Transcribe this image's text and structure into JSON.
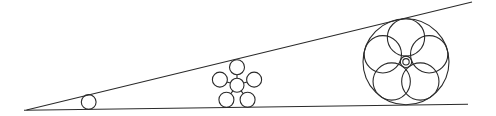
{
  "canvas": {
    "width": 496,
    "height": 116,
    "background": "#ffffff",
    "stroke_color": "#2a2a2a",
    "stroke_width": 1.1
  },
  "lines": [
    {
      "name": "ground-line",
      "x1": 24,
      "y1": 110.2,
      "x2": 468,
      "y2": 104.3
    },
    {
      "name": "incline-line",
      "x1": 26.5,
      "y1": 110,
      "x2": 472,
      "y2": 2
    }
  ],
  "small_circle": {
    "cx": 88.7,
    "cy": 102,
    "r": 7.4
  },
  "cluster": {
    "center_circle": {
      "cx": 237,
      "cy": 85.2,
      "r": 7
    },
    "satellite_r": 7.5,
    "orbit_r": 18,
    "spoke_inner_r": 7,
    "spoke_outer_r": 10.5,
    "angles_deg": [
      90,
      162,
      234,
      306,
      18
    ]
  },
  "rose": {
    "outer_circle": {
      "cx": 406,
      "cy": 61.8,
      "r": 43
    },
    "petal_r": 18.65,
    "petal_orbit_r": 24.35,
    "petal_angles_deg": [
      90,
      162,
      234,
      306,
      18
    ],
    "hub": {
      "cx": 406,
      "cy": 61.8,
      "outer_r": 5.7,
      "inner_r": 3.2
    }
  }
}
